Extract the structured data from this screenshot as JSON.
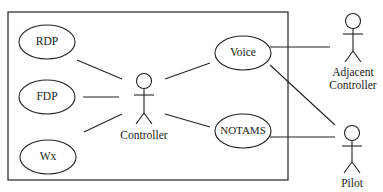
{
  "diagram": {
    "type": "use-case",
    "system_boundary": {
      "x": 8,
      "y": 12,
      "w": 280,
      "h": 168
    },
    "use_cases": [
      {
        "id": "rdp",
        "label": "RDP",
        "cx": 47,
        "cy": 42,
        "rx": 28,
        "ry": 17
      },
      {
        "id": "fdp",
        "label": "FDP",
        "cx": 47,
        "cy": 97,
        "rx": 28,
        "ry": 17
      },
      {
        "id": "wx",
        "label": "Wx",
        "cx": 48,
        "cy": 157,
        "rx": 28,
        "ry": 17
      },
      {
        "id": "voice",
        "label": "Voice",
        "cx": 243,
        "cy": 53,
        "rx": 28,
        "ry": 17
      },
      {
        "id": "notams",
        "label": "NOTAMS",
        "cx": 243,
        "cy": 131,
        "rx": 28,
        "ry": 17
      }
    ],
    "actors": [
      {
        "id": "controller",
        "label": "Controller",
        "x": 144,
        "head_y": 81
      },
      {
        "id": "adjacent-controller",
        "label_line1": "Adjacent",
        "label_line2": "Controller",
        "x": 353,
        "head_y": 21
      },
      {
        "id": "pilot",
        "label": "Pilot",
        "x": 352,
        "head_y": 133
      }
    ],
    "associations": [
      {
        "from": "rdp",
        "to": "controller"
      },
      {
        "from": "fdp",
        "to": "controller"
      },
      {
        "from": "wx",
        "to": "controller"
      },
      {
        "from": "controller",
        "to": "voice"
      },
      {
        "from": "controller",
        "to": "notams"
      },
      {
        "from": "voice",
        "to": "adjacent-controller"
      },
      {
        "from": "voice",
        "to": "pilot"
      },
      {
        "from": "notams",
        "to": "pilot"
      }
    ],
    "colors": {
      "stroke": "#222222",
      "background": "#ffffff"
    }
  }
}
